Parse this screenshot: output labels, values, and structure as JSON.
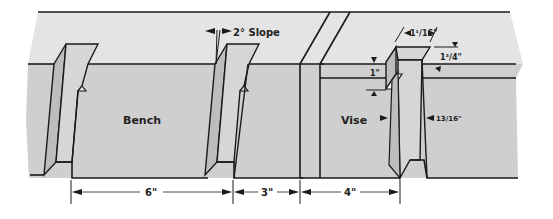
{
  "diagram": {
    "type": "technical-drawing",
    "labels": {
      "bench": "Bench",
      "vise": "Vise",
      "slope": "2° Slope"
    },
    "dimensions": {
      "bench_spacing": "6\"",
      "gap_spacing": "3\"",
      "vise_spacing": "4\"",
      "dog_width": "1¹/16\"",
      "dog_height": "1³/4\"",
      "slot_depth": "1\"",
      "slot_gap": "13/16\""
    },
    "colors": {
      "top_surface": "#e4e4e4",
      "front_face": "#cfcfcf",
      "dog_face": "#d6d6d6",
      "dog_side": "#bdbdbd",
      "line": "#1a1a1a",
      "background": "#ffffff"
    }
  }
}
